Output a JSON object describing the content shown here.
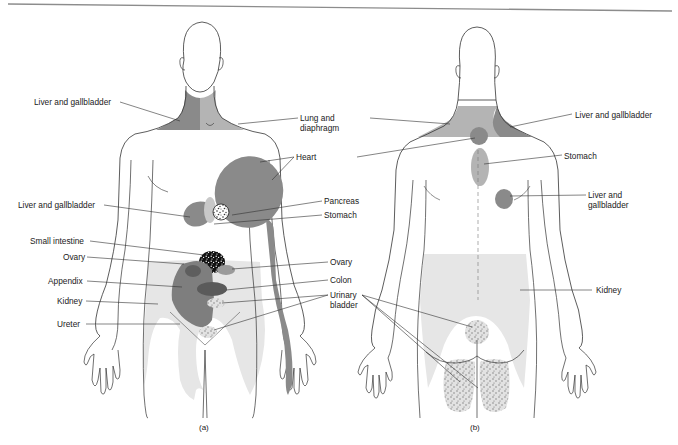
{
  "figure": {
    "type": "referred-pain-diagram",
    "colors": {
      "outline": "#333333",
      "dark_region": "#8a8a8a",
      "medium_region": "#b4b4b4",
      "light_region": "#e6e6e6",
      "leader_line": "#333333",
      "top_rule": "#8c8c8c"
    },
    "panel_a": {
      "caption": "(a)",
      "view": "anterior",
      "labels": {
        "liver_gallbladder_neck": "Liver and gallbladder",
        "lung_diaphragm_1": "Lung and",
        "lung_diaphragm_2": "diaphragm",
        "heart": "Heart",
        "liver_gallbladder_abdomen": "Liver and gallbladder",
        "pancreas": "Pancreas",
        "stomach": "Stomach",
        "small_intestine": "Small intestine",
        "ovary_left": "Ovary",
        "ovary_right": "Ovary",
        "appendix": "Appendix",
        "colon": "Colon",
        "kidney": "Kidney",
        "urinary_bladder_1": "Urinary",
        "urinary_bladder_2": "bladder",
        "ureter": "Ureter"
      }
    },
    "panel_b": {
      "caption": "(b)",
      "view": "posterior",
      "labels": {
        "liver_gallbladder_neck": "Liver and gallbladder",
        "stomach": "Stomach",
        "liver_gallbladder_back_1": "Liver and",
        "liver_gallbladder_back_2": "gallbladder",
        "kidney": "Kidney"
      }
    }
  }
}
